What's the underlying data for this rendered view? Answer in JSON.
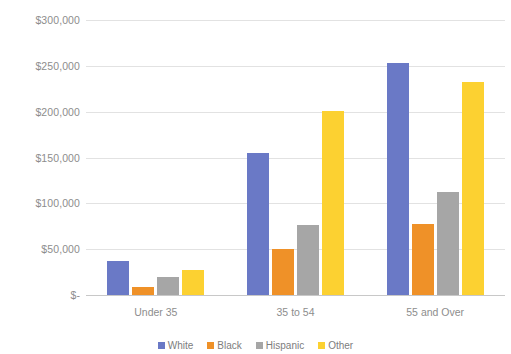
{
  "chart_data": {
    "type": "bar",
    "title": "",
    "subtitle": "",
    "xlabel": "",
    "ylabel": "",
    "categories": [
      "Under 35",
      "35 to 54",
      "55 and Over"
    ],
    "series": [
      {
        "name": "White",
        "color": "#6a79c6",
        "values": [
          37000,
          155000,
          253000
        ]
      },
      {
        "name": "Black",
        "color": "#ef9128",
        "values": [
          9000,
          50000,
          78000
        ]
      },
      {
        "name": "Hispanic",
        "color": "#a6a6a6",
        "values": [
          20000,
          76000,
          112000
        ]
      },
      {
        "name": "Other",
        "color": "#fcd131",
        "values": [
          27000,
          201000,
          232000
        ]
      }
    ],
    "ylim": [
      0,
      300000
    ],
    "ytick_values": [
      0,
      50000,
      100000,
      150000,
      200000,
      250000,
      300000
    ],
    "ytick_labels": [
      "$-",
      "$50,000",
      "$100,000",
      "$150,000",
      "$200,000",
      "$250,000",
      "$300,000"
    ],
    "grid": true,
    "grid_color": "#e2e2e2",
    "legend_position": "bottom",
    "axis_label_color": "#8d8d8d",
    "background": "#ffffff"
  }
}
